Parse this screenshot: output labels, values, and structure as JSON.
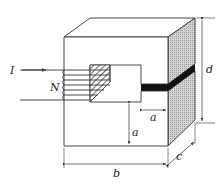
{
  "diagram": {
    "title": "",
    "labels": {
      "current": "I",
      "turns": "N",
      "gap_width": "a",
      "leg_height": "a",
      "width": "b",
      "depth": "c",
      "height": "d"
    },
    "colors": {
      "line": "#333333",
      "side_face": "#c8c8c8",
      "gap": "#111111",
      "hatch": "#444444",
      "background": "#ffffff"
    }
  }
}
